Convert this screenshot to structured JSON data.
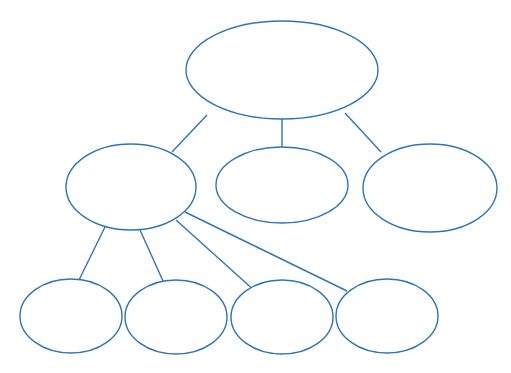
{
  "document": {
    "title": "Blank hierarchy concept map",
    "background_color": "#FFFFFF",
    "canvas": {
      "width": 511,
      "height": 373
    }
  },
  "style": {
    "node_stroke_color": "#2E75B6",
    "node_fill_color": "#FFFFFF",
    "node_stroke_width": 1.4,
    "connector_color": "#2E75B6",
    "connector_width": 1.4
  },
  "chart_data": {
    "type": "diagram",
    "subtype": "node-link-hierarchy",
    "title": "",
    "orientation": "top-down",
    "levels": 3,
    "node_count": 8,
    "edge_count": 7,
    "nodes": [
      {
        "id": "n1",
        "label": "",
        "level": 0,
        "cx": 282,
        "cy": 70,
        "rx": 96,
        "ry": 49
      },
      {
        "id": "n2",
        "label": "",
        "level": 1,
        "cx": 131,
        "cy": 187,
        "rx": 65,
        "ry": 43
      },
      {
        "id": "n3",
        "label": "",
        "level": 1,
        "cx": 282,
        "cy": 185,
        "rx": 66,
        "ry": 38
      },
      {
        "id": "n4",
        "label": "",
        "level": 1,
        "cx": 430,
        "cy": 188,
        "rx": 67,
        "ry": 44
      },
      {
        "id": "n5",
        "label": "",
        "level": 2,
        "cx": 71,
        "cy": 316,
        "rx": 51,
        "ry": 37
      },
      {
        "id": "n6",
        "label": "",
        "level": 2,
        "cx": 176,
        "cy": 317,
        "rx": 51,
        "ry": 37
      },
      {
        "id": "n7",
        "label": "",
        "level": 2,
        "cx": 282,
        "cy": 317,
        "rx": 51,
        "ry": 37
      },
      {
        "id": "n8",
        "label": "",
        "level": 2,
        "cx": 387,
        "cy": 316,
        "rx": 51,
        "ry": 37
      }
    ],
    "edges": [
      {
        "id": "e1",
        "from": "n1",
        "to": "n2",
        "x1": 207,
        "y1": 115,
        "x2": 172,
        "y2": 152
      },
      {
        "id": "e2",
        "from": "n1",
        "to": "n3",
        "x1": 282,
        "y1": 118,
        "x2": 282,
        "y2": 147
      },
      {
        "id": "e3",
        "from": "n1",
        "to": "n4",
        "x1": 345,
        "y1": 113,
        "x2": 381,
        "y2": 152
      },
      {
        "id": "e4",
        "from": "n2",
        "to": "n5",
        "x1": 105,
        "y1": 227,
        "x2": 79,
        "y2": 280
      },
      {
        "id": "e5",
        "from": "n2",
        "to": "n6",
        "x1": 140,
        "y1": 230,
        "x2": 163,
        "y2": 281
      },
      {
        "id": "e6",
        "from": "n2",
        "to": "n7",
        "x1": 176,
        "y1": 220,
        "x2": 256,
        "y2": 292
      },
      {
        "id": "e7",
        "from": "n2",
        "to": "n8",
        "x1": 185,
        "y1": 212,
        "x2": 347,
        "y2": 291
      }
    ]
  }
}
